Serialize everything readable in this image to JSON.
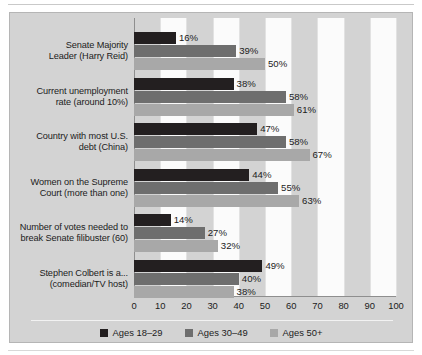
{
  "chart_data": {
    "type": "bar",
    "orientation": "horizontal",
    "title": "",
    "subtitle": "",
    "xlabel": "",
    "ylabel": "",
    "xlim": [
      0,
      100
    ],
    "xticks": [
      "0",
      "10",
      "20",
      "30",
      "40",
      "50",
      "60",
      "70",
      "80",
      "90",
      "100"
    ],
    "grid": true,
    "legend_position": "bottom",
    "categories": [
      "Senate Majority Leader (Harry Reid)",
      "Current unemployment rate (around 10%)",
      "Country with most U.S. debt (China)",
      "Women on the Supreme Court (more than one)",
      "Number of votes needed to break Senate filibuster (60)",
      "Stephen Colbert is a... (comedian/TV host)"
    ],
    "category_lines": [
      [
        "Senate Majority",
        "Leader (Harry Reid)"
      ],
      [
        "Current unemployment",
        "rate (around 10%)"
      ],
      [
        "Country with most U.S.",
        "debt (China)"
      ],
      [
        "Women on the Supreme",
        "Court (more than one)"
      ],
      [
        "Number of votes needed to",
        "break Senate filibuster (60)"
      ],
      [
        "Stephen Colbert is a...",
        "(comedian/TV host)"
      ]
    ],
    "series": [
      {
        "name": "Ages 18–29",
        "color": "#231f20",
        "values": [
          16,
          38,
          47,
          44,
          14,
          49
        ],
        "labels": [
          "16%",
          "38%",
          "47%",
          "44%",
          "14%",
          "49%"
        ]
      },
      {
        "name": "Ages 30–49",
        "color": "#6e6e6e",
        "values": [
          39,
          58,
          58,
          55,
          27,
          40
        ],
        "labels": [
          "39%",
          "58%",
          "58%",
          "55%",
          "27%",
          "40%"
        ]
      },
      {
        "name": "Ages 50+",
        "color": "#a8a8a8",
        "values": [
          50,
          61,
          67,
          63,
          32,
          38
        ],
        "labels": [
          "50%",
          "61%",
          "67%",
          "63%",
          "32%",
          "38%"
        ]
      }
    ]
  },
  "legend": {
    "items": [
      {
        "label": "Ages 18–29",
        "swatch": "#231f20"
      },
      {
        "label": "Ages 30–49",
        "swatch": "#6e6e6e"
      },
      {
        "label": "Ages 50+",
        "swatch": "#a8a8a8"
      }
    ]
  },
  "colors": {
    "panel_background": "#d3d3d3",
    "band_light": "#fbfbfb",
    "axis": "#8e8e8e",
    "text": "#1b1b1b"
  }
}
